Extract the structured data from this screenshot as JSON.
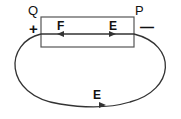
{
  "diagram": {
    "labels": {
      "left_terminal": "Q",
      "right_terminal": "P",
      "left_sign": "+",
      "right_sign": "—",
      "inside_left": "F",
      "inside_right": "E",
      "outer_loop": "E"
    },
    "colors": {
      "stroke": "#333333",
      "background": "#ffffff"
    }
  }
}
